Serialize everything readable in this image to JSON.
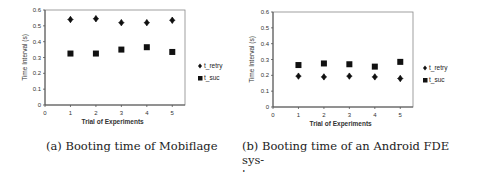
{
  "chart_data": [
    {
      "type": "scatter",
      "id": "a",
      "title": "",
      "caption": "(a) Booting time of Mobiflage",
      "xlabel": "Trial of Experiments",
      "ylabel": "Time Interval (s)",
      "xlim": [
        0,
        5.5
      ],
      "ylim": [
        0,
        0.6
      ],
      "xticks": [
        "0",
        "1",
        "2",
        "3",
        "4",
        "5"
      ],
      "yticks": [
        "0",
        "0.1",
        "0.2",
        "0.3",
        "0.4",
        "0.5",
        "0.6"
      ],
      "grid": false,
      "legend_position": "right",
      "x": [
        1,
        2,
        3,
        4,
        5
      ],
      "series": [
        {
          "name": "t_retry",
          "marker": "diamond",
          "values": [
            0.54,
            0.545,
            0.52,
            0.52,
            0.535
          ]
        },
        {
          "name": "t_suc",
          "marker": "square",
          "values": [
            0.325,
            0.325,
            0.35,
            0.365,
            0.335
          ]
        }
      ]
    },
    {
      "type": "scatter",
      "id": "b",
      "title": "",
      "caption": "(b) Booting time of an Android FDE sys- tem",
      "caption_lines": [
        "(b) Booting time of an Android FDE sys-",
        "tem"
      ],
      "xlabel": "Trial of Experiments",
      "ylabel": "Time Interval (s)",
      "xlim": [
        0,
        5.5
      ],
      "ylim": [
        0,
        0.6
      ],
      "xticks": [
        "0",
        "1",
        "2",
        "3",
        "4",
        "5"
      ],
      "yticks": [
        "0",
        "0.1",
        "0.2",
        "0.3",
        "0.4",
        "0.5",
        "0.6"
      ],
      "grid": false,
      "legend_position": "right",
      "x": [
        1,
        2,
        3,
        4,
        5
      ],
      "series": [
        {
          "name": "t_retry",
          "marker": "diamond",
          "values": [
            0.195,
            0.19,
            0.195,
            0.19,
            0.18
          ]
        },
        {
          "name": "t_suc",
          "marker": "square",
          "values": [
            0.265,
            0.275,
            0.27,
            0.255,
            0.285
          ]
        }
      ]
    }
  ],
  "colors": {
    "marker": "#111111",
    "axis": "#555555",
    "frame": "#888888",
    "text": "#333333"
  }
}
